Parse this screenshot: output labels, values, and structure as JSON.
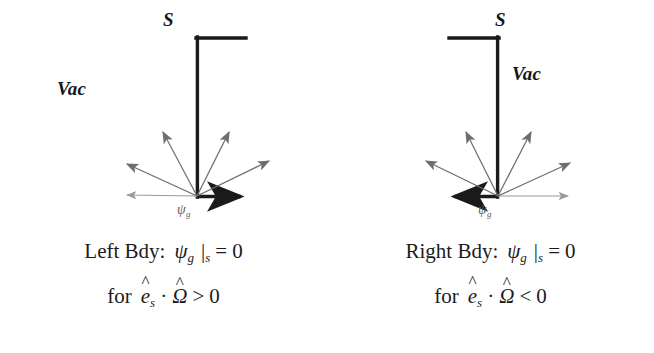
{
  "figure": {
    "title_present": false,
    "background_color": "#ffffff",
    "line_color": "#1a1a1a",
    "arrow_color": "#6b6b6b"
  },
  "panels": [
    {
      "id": "left",
      "surface_label": "S",
      "vacuum_label": "Vac",
      "flux_label": "ψ",
      "flux_label_sub": "g",
      "boundary_side": "left",
      "wall_position": "right-of-vacuum",
      "bottom_arrow_direction": "right",
      "caption": {
        "line1": {
          "lead": "Left Bdy:",
          "symbol": "ψ",
          "symbol_sub": "g",
          "evaluated_at": "|",
          "evaluated_sub": "s",
          "relation": "=",
          "value": "0"
        },
        "line2": {
          "lead": "for",
          "unit_vector": "e",
          "unit_vector_sub": "s",
          "operator": "·",
          "direction_vector": "Ω",
          "relation": ">",
          "value": "0"
        }
      },
      "fan_arrows": [
        {
          "angle_deg": 180,
          "length": 74,
          "weight": "light"
        },
        {
          "angle_deg": 156,
          "length": 78,
          "weight": "normal"
        },
        {
          "angle_deg": 118,
          "length": 72,
          "weight": "normal"
        },
        {
          "angle_deg": 64,
          "length": 72,
          "weight": "normal"
        },
        {
          "angle_deg": 26,
          "length": 80,
          "weight": "normal"
        },
        {
          "angle_deg": 2,
          "length": 70,
          "weight": "light"
        }
      ]
    },
    {
      "id": "right",
      "surface_label": "S",
      "vacuum_label": "Vac",
      "flux_label": "ψ",
      "flux_label_sub": "g",
      "boundary_side": "right",
      "wall_position": "left-of-vacuum",
      "bottom_arrow_direction": "left",
      "caption": {
        "line1": {
          "lead": "Right Bdy:",
          "symbol": "ψ",
          "symbol_sub": "g",
          "evaluated_at": "|",
          "evaluated_sub": "s",
          "relation": "=",
          "value": "0"
        },
        "line2": {
          "lead": "for",
          "unit_vector": "e",
          "unit_vector_sub": "s",
          "operator": "·",
          "direction_vector": "Ω",
          "relation": "<",
          "value": "0"
        }
      },
      "fan_arrows": [
        {
          "angle_deg": 178,
          "length": 74,
          "weight": "light"
        },
        {
          "angle_deg": 154,
          "length": 78,
          "weight": "normal"
        },
        {
          "angle_deg": 116,
          "length": 72,
          "weight": "normal"
        },
        {
          "angle_deg": 62,
          "length": 72,
          "weight": "normal"
        },
        {
          "angle_deg": 24,
          "length": 80,
          "weight": "normal"
        },
        {
          "angle_deg": 0,
          "length": 70,
          "weight": "light"
        }
      ]
    }
  ]
}
